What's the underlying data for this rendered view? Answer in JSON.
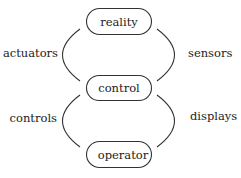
{
  "diagram": {
    "nodes": [
      {
        "id": "reality",
        "label": "reality"
      },
      {
        "id": "control",
        "label": "control"
      },
      {
        "id": "operator",
        "label": "operator"
      }
    ],
    "edges": [
      {
        "from": "control",
        "to": "reality",
        "side": "left",
        "label": "actuators"
      },
      {
        "from": "reality",
        "to": "control",
        "side": "right",
        "label": "sensors"
      },
      {
        "from": "operator",
        "to": "control",
        "side": "left",
        "label": "controls"
      },
      {
        "from": "control",
        "to": "operator",
        "side": "right",
        "label": "displays"
      }
    ]
  }
}
